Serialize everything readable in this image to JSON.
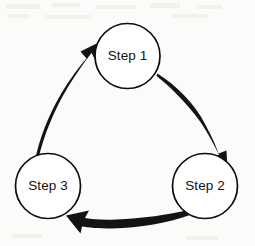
{
  "diagram": {
    "type": "cycle-diagram",
    "background_color": "#fbfbf9",
    "node_fill_color": "#ffffff",
    "node_stroke_color": "#0d0d0d",
    "arrow_color": "#131313",
    "text_color": "#111111",
    "nodes": [
      {
        "id": "step-1",
        "label": "Step 1",
        "cx": 127.5,
        "cy": 56,
        "r": 32.5,
        "position": "top-center"
      },
      {
        "id": "step-2",
        "label": "Step 2",
        "cx": 205,
        "cy": 186,
        "r": 32.5,
        "position": "bottom-right"
      },
      {
        "id": "step-3",
        "label": "Step 3",
        "cx": 48,
        "cy": 186,
        "r": 32.5,
        "position": "bottom-left"
      }
    ],
    "arrows": [
      {
        "id": "arrow-step1-step2",
        "from": "step-1",
        "to": "step-2",
        "direction": "clockwise",
        "style": "tapered-curve"
      },
      {
        "id": "arrow-step2-step3",
        "from": "step-2",
        "to": "step-3",
        "direction": "clockwise",
        "style": "tapered-curve"
      },
      {
        "id": "arrow-step3-step1",
        "from": "step-3",
        "to": "step-1",
        "direction": "clockwise",
        "style": "tapered-curve"
      }
    ]
  }
}
